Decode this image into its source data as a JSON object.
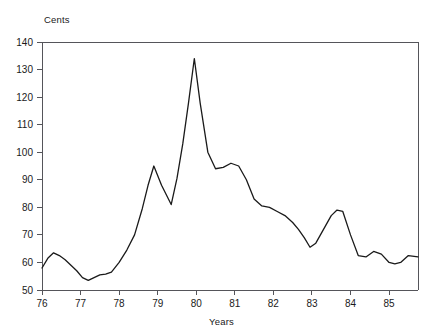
{
  "chart_data": {
    "type": "line",
    "title": "",
    "xlabel": "Years",
    "ylabel": "Cents",
    "ylim": [
      50,
      140
    ],
    "xlim": [
      76,
      85.75
    ],
    "grid": false,
    "legend": null,
    "y_ticks": [
      50,
      60,
      70,
      80,
      90,
      100,
      110,
      120,
      130,
      140
    ],
    "y_ticklabels": [
      "50",
      "60",
      "70",
      "80",
      "90",
      "100",
      "110",
      "120",
      "130",
      "140"
    ],
    "x_ticks": [
      76,
      77,
      78,
      79,
      80,
      81,
      82,
      83,
      84,
      85
    ],
    "x_ticklabels": [
      "76",
      "77",
      "78",
      "79",
      "80",
      "81",
      "82",
      "83",
      "84",
      "85"
    ],
    "line_color": "#1a1a1a",
    "series": [
      {
        "name": "Price",
        "x": [
          76.0,
          76.15,
          76.3,
          76.45,
          76.6,
          76.75,
          76.9,
          77.05,
          77.2,
          77.35,
          77.5,
          77.65,
          77.8,
          78.0,
          78.2,
          78.4,
          78.6,
          78.75,
          78.9,
          79.1,
          79.35,
          79.5,
          79.65,
          79.8,
          79.95,
          80.1,
          80.3,
          80.5,
          80.7,
          80.9,
          81.1,
          81.3,
          81.5,
          81.7,
          81.9,
          82.1,
          82.3,
          82.5,
          82.65,
          82.8,
          82.95,
          83.1,
          83.3,
          83.5,
          83.65,
          83.8,
          84.0,
          84.2,
          84.4,
          84.6,
          84.8,
          85.0,
          85.15,
          85.3,
          85.5,
          85.75
        ],
        "y": [
          58.0,
          61.5,
          63.5,
          62.5,
          61.0,
          59.0,
          57.0,
          54.5,
          53.5,
          54.5,
          55.5,
          55.8,
          56.5,
          60.0,
          64.5,
          70.0,
          79.5,
          88.0,
          95.0,
          88.0,
          81.0,
          90.5,
          103.0,
          118.0,
          134.0,
          118.0,
          100.0,
          94.0,
          94.5,
          96.0,
          95.0,
          90.0,
          83.0,
          80.5,
          80.0,
          78.5,
          77.0,
          74.5,
          72.0,
          69.0,
          65.5,
          67.0,
          72.0,
          77.0,
          79.0,
          78.5,
          70.0,
          62.5,
          62.0,
          64.0,
          63.0,
          60.0,
          59.5,
          60.0,
          62.5,
          62.0
        ],
        "y_detail": [
          58.0,
          61.5,
          63.5,
          62.5,
          61.0,
          59.0,
          57.0,
          54.5,
          53.5,
          54.5,
          55.5,
          55.8,
          56.5,
          60.0,
          64.5,
          70.0,
          79.5,
          88.0,
          95.0,
          88.0,
          81.0,
          90.5,
          103.0,
          118.0,
          134.0,
          118.0,
          100.0,
          94.0,
          94.5,
          96.0,
          95.0,
          90.0,
          83.0,
          80.5,
          80.0,
          78.5,
          77.0,
          74.5,
          72.0,
          69.0,
          65.5,
          67.0,
          72.0,
          77.0,
          79.0,
          78.5,
          70.0,
          62.5,
          62.0,
          64.0,
          63.0,
          60.0,
          59.5,
          60.0,
          62.5,
          62.0
        ]
      }
    ],
    "annotations": {
      "peak_value": 134,
      "peak_x": 79.35,
      "min_value": 53.5,
      "min_x": 77.2,
      "start_value": 58.0,
      "end_value": 62.0
    }
  }
}
